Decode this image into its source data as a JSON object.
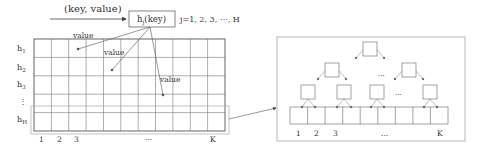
{
  "input": {
    "label": "(key, value)"
  },
  "hash_box": {
    "label": "h",
    "subscript": "j",
    "arg": "(key)"
  },
  "hash_range": {
    "label": "j=1, 2, 3, ⋯, H"
  },
  "value_labels": [
    "value",
    "value",
    "value"
  ],
  "matrix": {
    "rows": 5,
    "cols": 11,
    "row_labels": [
      {
        "base": "h",
        "sub": "1"
      },
      {
        "base": "h",
        "sub": "2"
      },
      {
        "base": "h",
        "sub": "3"
      },
      {
        "base": "⋮",
        "sub": ""
      },
      {
        "base": "h",
        "sub": "H"
      }
    ],
    "col_labels": [
      "1",
      "2",
      "3",
      "···",
      "K"
    ]
  },
  "tree_panel": {
    "col_labels": [
      "1",
      "2",
      "3",
      "···",
      "K"
    ],
    "ellipsis_level2": "···",
    "ellipsis_level3": "···",
    "leaf_cells": 9
  },
  "colors": {
    "line": "#555555",
    "grid": "#666666",
    "highlight": "#999999"
  }
}
